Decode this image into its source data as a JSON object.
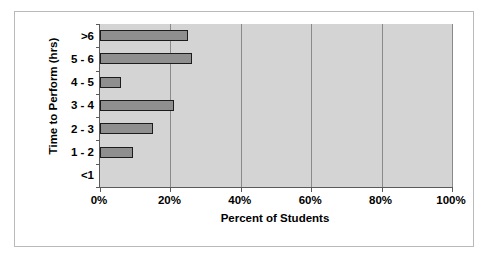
{
  "chart_data": {
    "type": "bar",
    "orientation": "horizontal",
    "title": "",
    "xlabel": "Percent of Students",
    "ylabel": "Time to Perform (hrs)",
    "categories": [
      ">6",
      "5 - 6",
      "4 - 5",
      "3 - 4",
      "2 - 3",
      "1 - 2",
      "<1"
    ],
    "values": [
      25,
      26,
      6,
      21,
      15,
      9.5,
      0
    ],
    "xlim": [
      0,
      100
    ],
    "xticks": [
      0,
      20,
      40,
      60,
      80,
      100
    ],
    "xtick_labels": [
      "0%",
      "20%",
      "40%",
      "60%",
      "80%",
      "100%"
    ],
    "grid": true,
    "grid_axis": "x",
    "legend": "none",
    "plot_background": "#d4d4d4",
    "bar_fill": "#8f8f8f",
    "bar_edge": "#1c1c1c",
    "gridline_color": "#8a8a8a",
    "axis_color": "#5a5a5a",
    "frame_border": "#b9b9b9"
  }
}
